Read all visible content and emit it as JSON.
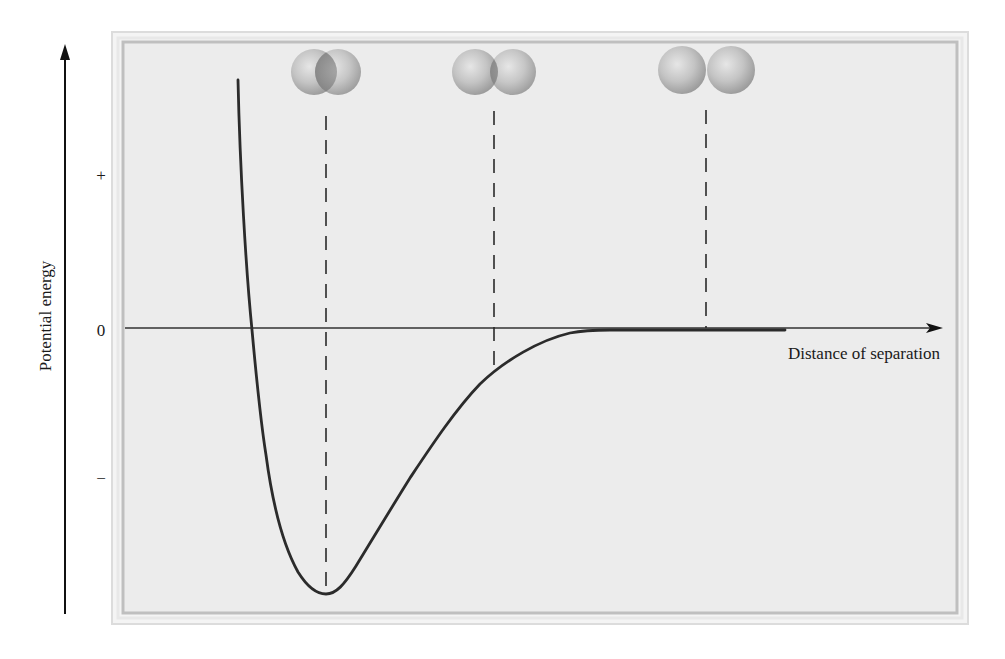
{
  "figure": {
    "y_axis": {
      "label": "Potential energy",
      "ticks": [
        {
          "label": "+",
          "y": 175
        },
        {
          "label": "0",
          "y": 330
        },
        {
          "label": "−",
          "y": 478
        }
      ]
    },
    "x_axis": {
      "label": "Distance of separation"
    },
    "atom_pairs": [
      {
        "name": "strongly-overlapping-pair",
        "description": "Atoms too close (repulsion)",
        "x_marker": 326
      },
      {
        "name": "slightly-overlapping-pair",
        "description": "Atoms approaching (attraction)",
        "x_marker": 494
      },
      {
        "name": "separated-pair",
        "description": "Atoms far apart (no interaction)",
        "x_marker": 706
      }
    ],
    "colors": {
      "background": "#ffffff",
      "panel": "#ececec",
      "panel_border_outer": "#d9d9d9",
      "panel_border_inner": "#bdbdbd",
      "curve": "#2b2b2b",
      "axis": "#333333",
      "sphere": "#b9b9b9"
    }
  }
}
